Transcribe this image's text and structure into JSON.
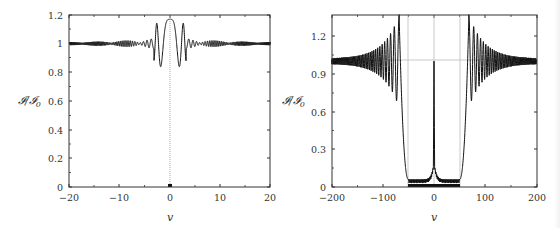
{
  "chart_data": [
    {
      "type": "line",
      "panel": "left",
      "title": "",
      "xlabel": "v",
      "ylabel": "I/I_0",
      "xlim": [
        -20,
        20
      ],
      "ylim": [
        0,
        1.2
      ],
      "xticks": [
        "−20",
        "−10",
        "0",
        "10",
        "20"
      ],
      "yticks": [
        "0",
        "0.2",
        "0.4",
        "0.6",
        "0.8",
        "1",
        "1.2"
      ],
      "grid": false,
      "legend": null,
      "annotations": [
        "dotted vertical line at v=0",
        "marker at (0, 0)"
      ],
      "series": [
        {
          "name": "intensity",
          "description": "Oscillating intensity centered at 1, strongest oscillations near v=0 with peaks ~1.18 and troughs ~0.83, decaying beat envelope toward |v|=20",
          "x": [
            -20,
            -15,
            -10,
            -8,
            -6,
            -5,
            -4,
            -3,
            -2,
            -1.5,
            -1,
            -0.5,
            0,
            0.5,
            1,
            1.5,
            2,
            3,
            4,
            5,
            6,
            8,
            10,
            15,
            20
          ],
          "y": [
            1.0,
            1.0,
            1.0,
            1.01,
            1.02,
            1.03,
            1.05,
            1.1,
            1.16,
            0.84,
            1.18,
            0.83,
            1.0,
            0.83,
            1.18,
            0.84,
            1.16,
            1.1,
            1.05,
            1.03,
            1.02,
            1.01,
            1.0,
            1.0,
            1.0
          ]
        }
      ]
    },
    {
      "type": "line",
      "panel": "right",
      "title": "",
      "xlabel": "v",
      "ylabel": "I/I_0",
      "xlim": [
        -200,
        200
      ],
      "ylim": [
        0,
        1.4
      ],
      "xticks": [
        "−200",
        "−100",
        "0",
        "100",
        "200"
      ],
      "yticks": [
        "0",
        "0.3",
        "0.6",
        "0.9",
        "1.2"
      ],
      "grid": false,
      "legend": null,
      "annotations": [
        "dotted horizontal reference line at 1.0",
        "dotted vertical lines at v=−50, 0, 50",
        "thick bar on baseline from v=−50 to v=50"
      ],
      "series": [
        {
          "name": "intensity",
          "description": "Near zero for |v|<50 with small cusps (~0.15) near v=0 and a narrow spike to 1.0 at v=0; steep rise near |v|≈55–65 to peak ~1.35 at |v|≈68, then decaying oscillations around 1.0",
          "x": [
            -200,
            -150,
            -120,
            -100,
            -90,
            -80,
            -75,
            -70,
            -68,
            -65,
            -60,
            -55,
            -50,
            -30,
            -10,
            -3,
            0,
            3,
            10,
            30,
            50,
            55,
            60,
            65,
            68,
            70,
            75,
            80,
            90,
            100,
            120,
            150,
            200
          ],
          "y": [
            1.0,
            1.02,
            1.06,
            1.1,
            0.88,
            1.15,
            0.8,
            1.2,
            1.35,
            1.0,
            0.6,
            0.25,
            0.08,
            0.03,
            0.06,
            0.15,
            1.0,
            0.15,
            0.06,
            0.03,
            0.08,
            0.25,
            0.6,
            1.0,
            1.35,
            1.2,
            0.8,
            1.15,
            0.88,
            1.1,
            1.06,
            1.02,
            1.0
          ]
        }
      ]
    }
  ],
  "left": {
    "ylabel": "𝓘/𝓘",
    "ylabel_sub": "0",
    "xlabel": "v",
    "xticks": [
      {
        "label": "−20",
        "px": 69
      },
      {
        "label": "−10",
        "px": 119
      },
      {
        "label": "0",
        "px": 170
      },
      {
        "label": "10",
        "px": 220
      },
      {
        "label": "20",
        "px": 270
      }
    ],
    "yticks": [
      {
        "label": "0",
        "py": 187
      },
      {
        "label": "0.2",
        "py": 158
      },
      {
        "label": "0.4",
        "py": 130
      },
      {
        "label": "0.6",
        "py": 101
      },
      {
        "label": "0.8",
        "py": 72
      },
      {
        "label": "1",
        "py": 43
      },
      {
        "label": "1.2",
        "py": 15
      }
    ]
  },
  "right": {
    "ylabel": "𝓘/𝓘",
    "ylabel_sub": "0",
    "xlabel": "v",
    "xticks": [
      {
        "label": "−200",
        "px": 52
      },
      {
        "label": "−100",
        "px": 103
      },
      {
        "label": "0",
        "px": 154
      },
      {
        "label": "100",
        "px": 205
      },
      {
        "label": "200",
        "px": 257
      }
    ],
    "yticks": [
      {
        "label": "0",
        "py": 187
      },
      {
        "label": "0.3",
        "py": 149
      },
      {
        "label": "0.6",
        "py": 112
      },
      {
        "label": "0.9",
        "py": 74
      },
      {
        "label": "1.2",
        "py": 36
      }
    ]
  }
}
